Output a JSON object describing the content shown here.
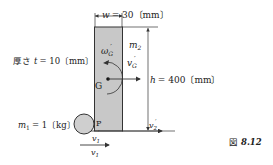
{
  "figure": {
    "caption_prefix": "図",
    "caption_number": "8.12"
  },
  "labels": {
    "width": "w = 30〔mm〕",
    "width_var": "w",
    "width_val": "= 30〔mm〕",
    "thickness_prefix": "厚さ",
    "thickness_var": "t",
    "thickness_val": "= 10〔mm〕",
    "height_var": "h",
    "height_val": "= 400〔mm〕",
    "mass2": "m",
    "mass2_sub": "2",
    "mass1": "m",
    "mass1_sub": "1",
    "mass1_val": "= 1〔kg〕",
    "omega": "ω",
    "omega_sub": "G",
    "prime": "′",
    "vG": "v",
    "vG_sub": "G",
    "G": "G",
    "P": "P",
    "v2": "v",
    "v2_sub": "2",
    "v1": "v",
    "v1_sub": "1"
  },
  "colors": {
    "bar_fill": "#c8c8c8",
    "ball_fill": "#cfcfcf",
    "line": "#333333"
  }
}
